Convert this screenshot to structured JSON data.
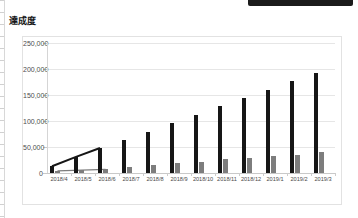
{
  "window": {
    "top_strip_color": "#1b1b1b"
  },
  "chart_title": "達成度",
  "chart_data": {
    "type": "bar",
    "title": "達成度",
    "xlabel": "",
    "ylabel": "",
    "categories": [
      "2018/4",
      "2018/5",
      "2018/6",
      "2018/7",
      "2018/8",
      "2018/9",
      "2018/10",
      "2018/11",
      "2018/12",
      "2019/1",
      "2019/2",
      "2019/3"
    ],
    "series": [
      {
        "name": "series-1",
        "color": "#161616",
        "values": [
          13000,
          31000,
          48000,
          63000,
          79000,
          96000,
          112000,
          128000,
          144000,
          160000,
          176000,
          192000
        ]
      },
      {
        "name": "series-2",
        "color": "#7d7d7d",
        "values": [
          4000,
          5500,
          7000,
          12000,
          16000,
          19000,
          22000,
          26000,
          29000,
          32000,
          35000,
          40000
        ]
      }
    ],
    "ylim": [
      0,
      250000
    ],
    "yticks": [
      0,
      50000,
      100000,
      150000,
      200000,
      250000
    ],
    "ytick_labels": [
      "0",
      "50,000",
      "100,000",
      "150,000",
      "200,000",
      "250,000"
    ],
    "grid": true,
    "legend": false,
    "trend_overlay": {
      "present": true,
      "through_points": 3,
      "description": "connected line segments over the first three categories for both series"
    }
  }
}
